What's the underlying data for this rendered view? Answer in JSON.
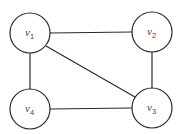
{
  "graph": {
    "nodes": [
      {
        "id": "v1",
        "label": "v",
        "subscript": "1",
        "cx": 30,
        "cy": 33,
        "r": 20
      },
      {
        "id": "v2",
        "label": "v",
        "subscript": "2",
        "cx": 152,
        "cy": 32,
        "r": 20
      },
      {
        "id": "v3",
        "label": "v",
        "subscript": "3",
        "cx": 152,
        "cy": 108,
        "r": 20
      },
      {
        "id": "v4",
        "label": "v",
        "subscript": "4",
        "cx": 30,
        "cy": 109,
        "r": 20
      }
    ],
    "edges": [
      {
        "from": "v1",
        "to": "v2"
      },
      {
        "from": "v1",
        "to": "v4"
      },
      {
        "from": "v1",
        "to": "v3"
      },
      {
        "from": "v2",
        "to": "v3"
      },
      {
        "from": "v4",
        "to": "v3"
      }
    ]
  },
  "colors": {
    "stroke": "#2a2a2a",
    "label": "#444444",
    "background": "#ffffff"
  }
}
